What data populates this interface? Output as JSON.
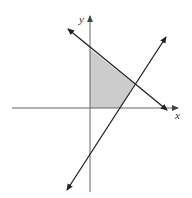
{
  "diagram": {
    "type": "coordinate-plane-feasible-region",
    "axes": {
      "x_label": "x",
      "y_label": "y"
    },
    "lines": [
      {
        "name": "decreasing-line",
        "direction": "negative slope",
        "from": [
          68,
          29
        ],
        "to": [
          167,
          110
        ]
      },
      {
        "name": "increasing-line",
        "direction": "positive slope",
        "from": [
          67,
          190
        ],
        "to": [
          166,
          37
        ]
      }
    ],
    "shaded_region": {
      "description": "Quadrilateral bounded by y-axis, x-axis, decreasing line and increasing line",
      "vertices": [
        [
          90,
          49
        ],
        [
          134,
          84
        ],
        [
          120,
          108
        ],
        [
          90,
          108
        ]
      ],
      "fill": "#cccccc"
    },
    "colors": {
      "line": "#222222",
      "axis": "#555555",
      "shade": "#cccccc"
    }
  }
}
